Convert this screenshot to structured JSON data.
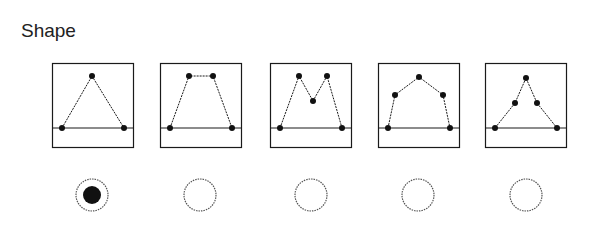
{
  "title": "Shape",
  "selected_index": 0,
  "colors": {
    "stroke": "#1a1a1a",
    "dot": "#111111",
    "radio_border": "#555555"
  },
  "options": [
    {
      "name": "triangle",
      "box_x": 52,
      "points": [
        [
          10,
          65
        ],
        [
          40,
          13
        ],
        [
          72,
          65
        ]
      ]
    },
    {
      "name": "trapezoid",
      "box_x": 160,
      "points": [
        [
          10,
          65
        ],
        [
          29,
          13
        ],
        [
          53,
          13
        ],
        [
          72,
          65
        ]
      ]
    },
    {
      "name": "m-shape",
      "box_x": 270,
      "points": [
        [
          10,
          65
        ],
        [
          29,
          13
        ],
        [
          43,
          38
        ],
        [
          57,
          13
        ],
        [
          72,
          65
        ]
      ]
    },
    {
      "name": "arch",
      "box_x": 378,
      "points": [
        [
          10,
          65
        ],
        [
          17,
          32
        ],
        [
          41,
          14
        ],
        [
          65,
          32
        ],
        [
          72,
          65
        ]
      ]
    },
    {
      "name": "peaked-triangle",
      "box_x": 485,
      "points": [
        [
          10,
          65
        ],
        [
          30,
          40
        ],
        [
          41,
          15
        ],
        [
          52,
          40
        ],
        [
          72,
          65
        ]
      ]
    }
  ],
  "radios": [
    {
      "cx": 92,
      "checked": true
    },
    {
      "cx": 200,
      "checked": false
    },
    {
      "cx": 311,
      "checked": false
    },
    {
      "cx": 418,
      "checked": false
    },
    {
      "cx": 526,
      "checked": false
    }
  ]
}
